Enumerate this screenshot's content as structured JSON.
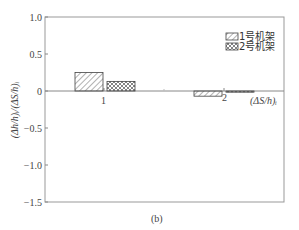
{
  "chart_data": {
    "type": "bar",
    "title": "",
    "caption": "(b)",
    "xlabel": "(ΔS/h)ᵢ",
    "ylabel": "(Δh/h)ᵢ/(ΔS/h)ᵢ",
    "ylim": [
      -1.5,
      1.0
    ],
    "yticks": [
      1.0,
      0.5,
      0,
      -0.5,
      -1.0,
      -1.5
    ],
    "ytick_labels": [
      "1.0",
      "0.5",
      "0",
      "−0.5",
      "−1.0",
      "−1.5"
    ],
    "categories": [
      "1",
      "2"
    ],
    "series": [
      {
        "name": "1号机架",
        "pattern": "diagonal-hatch",
        "values": [
          0.25,
          -0.07
        ]
      },
      {
        "name": "2号机架",
        "pattern": "cross-hatch",
        "values": [
          0.13,
          -0.01
        ]
      }
    ],
    "legend_position": "upper right",
    "grid": false
  },
  "colors": {
    "axis": "#777777",
    "bar_stroke": "#444444",
    "hatch": "#666666",
    "background": "#ffffff"
  }
}
